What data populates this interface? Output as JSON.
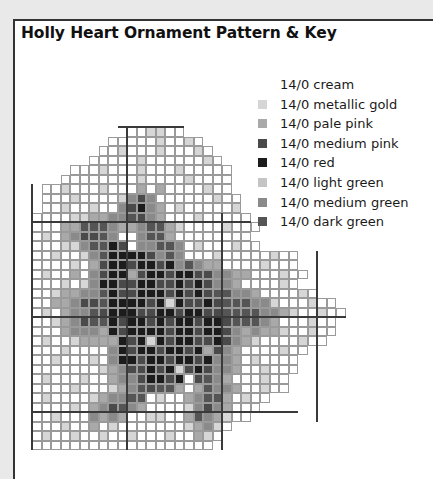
{
  "header": {
    "title": "Holly Heart Ornament Pattern & Key"
  },
  "legend": {
    "items": [
      {
        "label": "14/0 cream",
        "code": "c",
        "color": "#ffffff"
      },
      {
        "label": "14/0 metallic gold",
        "code": "g",
        "color": "#d6d6d6"
      },
      {
        "label": "14/0 pale pink",
        "code": "p",
        "color": "#a9a9a9"
      },
      {
        "label": "14/0 medium pink",
        "code": "m",
        "color": "#4a4a4a"
      },
      {
        "label": "14/0 red",
        "code": "r",
        "color": "#1c1c1c"
      },
      {
        "label": "14/0 light green",
        "code": "l",
        "color": "#c4c4c4"
      },
      {
        "label": "14/0 medium green",
        "code": "n",
        "color": "#8a8a8a"
      },
      {
        "label": "14/0 dark green",
        "code": "d",
        "color": "#555555"
      }
    ]
  },
  "pattern": {
    "origin_x": 32,
    "origin_y": 127,
    "cell_size": 9.5,
    "guide_every": 10,
    "rows": [
      {
        "start": 10,
        "cells": "ccggcc"
      },
      {
        "start": 8,
        "cells": "cccccgccgc"
      },
      {
        "start": 7,
        "cells": "ccgcccgcccgc"
      },
      {
        "start": 6,
        "cells": "cccccgccccccgc"
      },
      {
        "start": 4,
        "cells": "cccgcccgcccgccccc"
      },
      {
        "start": 3,
        "cells": "ccccccccgccccgcccc"
      },
      {
        "start": 1,
        "cells": "ccgcccgcccpcpccccgcc"
      },
      {
        "start": 1,
        "cells": "cccgccccgnmnccccccgcc"
      },
      {
        "start": 1,
        "cells": "ccgccgccnmrnpcgcccccg"
      },
      {
        "start": 0,
        "cells": "ccccggppnndmnpcccgccccc"
      },
      {
        "start": 0,
        "cells": "cccppdddnppnddpgccccgccc"
      },
      {
        "start": 0,
        "cells": "cgcpnmmdnccnddpcccccccc"
      },
      {
        "start": 0,
        "cells": "cccggnddrmcnnddncgcccgcc"
      },
      {
        "start": 0,
        "cells": "ccgccgndrrrrmndncccgcccccgcc"
      },
      {
        "start": 0,
        "cells": "ccccgcpmrrmrrmrndnppccccgccc"
      },
      {
        "start": 0,
        "cells": "cgccpcnmrrpmrrmrrmmnnppcccgcc"
      },
      {
        "start": 0,
        "cells": "cccgcgnrrmmrrmmrmrmnnpccccgc"
      },
      {
        "start": 0,
        "cells": "ccgppnndrmmrrrmrmrmddnnpccccgc"
      },
      {
        "start": 0,
        "cells": "ccppnmmdrrrrmrgrmmrmdddnngcccgcc"
      },
      {
        "start": 0,
        "cells": "cgcpnndmrrrmmrrmrrmmddddnnpgccgcc"
      },
      {
        "start": 0,
        "cells": "ccgpnmddrmrrmrmrrmrrmdddnpcccgcc"
      },
      {
        "start": 0,
        "cells": "cccpnnnprmrrrrmrrmrrmnpnppgccgcc"
      },
      {
        "start": 0,
        "cells": "cgccgpppprmrgrmrrmmrmnpgccccgcc"
      },
      {
        "start": 0,
        "cells": "cccgccccnrmrrmrrmrpmnpccccgcc"
      },
      {
        "start": 0,
        "cells": "ccgcccgcnrrmrrmrrmrnnpcgcccc"
      },
      {
        "start": 0,
        "cells": "cccccccgpnmmrmrgmrmnnpccgccc"
      },
      {
        "start": 0,
        "cells": "cgcccgccpnnmrrmrcmdnpcccgcc"
      },
      {
        "start": 0,
        "cells": "ccccgcccgpndmddpcpdnnpccgcc"
      },
      {
        "start": 0,
        "cells": "cgccccgpnnddcgccpnddpcgcc"
      },
      {
        "start": 0,
        "cells": "ccccgcpnmdnpccccgnmnpccc"
      },
      {
        "start": 0,
        "cells": "ccgcccnpnpccggccpdnpgcc"
      },
      {
        "start": 0,
        "cells": "cccgccpcgcccccccgpngc"
      },
      {
        "start": 0,
        "cells": "cgccgccgccgcccgccpgc"
      },
      {
        "start": 0,
        "cells": "ccccccccccccccccccc"
      }
    ],
    "guides": {
      "vertical": [
        {
          "col": 10,
          "from_row": 0,
          "to_row": 34
        },
        {
          "col": 20,
          "from_row": 9,
          "to_row": 34
        },
        {
          "col": 30,
          "from_row": 13,
          "to_row": 31
        }
      ],
      "horizontal": [
        {
          "row": 0,
          "from_col": 9,
          "to_col": 16
        },
        {
          "row": 10,
          "from_col": 0,
          "to_col": 23
        },
        {
          "row": 20,
          "from_col": 0,
          "to_col": 33
        },
        {
          "row": 30,
          "from_col": 0,
          "to_col": 28
        }
      ],
      "left_edge": {
        "col": 0,
        "from_row": 6,
        "to_row": 34
      }
    }
  }
}
